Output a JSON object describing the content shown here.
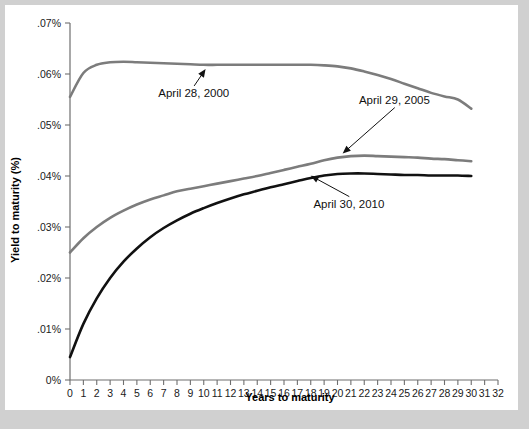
{
  "figure": {
    "background_color": "#d0d0d0",
    "plot_background_color": "#ffffff"
  },
  "chart_data": {
    "type": "line",
    "title": "",
    "xlabel": "Years to maturity",
    "ylabel": "Yield to maturity (%)",
    "xlim": [
      0,
      32
    ],
    "ylim": [
      0,
      0.07
    ],
    "grid": false,
    "legend_position": "inline-annotations",
    "x_tick_labels": [
      "0",
      "1",
      "2",
      "3",
      "4",
      "5",
      "6",
      "7",
      "8",
      "9",
      "10",
      "11",
      "12",
      "13",
      "14",
      "15",
      "16",
      "17",
      "18",
      "19",
      "20",
      "21",
      "22",
      "23",
      "24",
      "25",
      "26",
      "27",
      "28",
      "29",
      "30",
      "31",
      "32"
    ],
    "x_ticks": [
      0,
      1,
      2,
      3,
      4,
      5,
      6,
      7,
      8,
      9,
      10,
      11,
      12,
      13,
      14,
      15,
      16,
      17,
      18,
      19,
      20,
      21,
      22,
      23,
      24,
      25,
      26,
      27,
      28,
      29,
      30,
      31,
      32
    ],
    "y_tick_labels": [
      "0%",
      ".01%",
      ".02%",
      ".03%",
      ".04%",
      ".05%",
      ".06%",
      ".07%"
    ],
    "y_ticks": [
      0,
      0.01,
      0.02,
      0.03,
      0.04,
      0.05,
      0.06,
      0.07
    ],
    "x": [
      0,
      1,
      2,
      3,
      4,
      5,
      6,
      7,
      8,
      9,
      10,
      11,
      12,
      13,
      14,
      15,
      16,
      17,
      18,
      19,
      20,
      21,
      22,
      23,
      24,
      25,
      26,
      27,
      28,
      29,
      30
    ],
    "series": [
      {
        "name": "April 28, 2000",
        "color": "#7c7c7c",
        "width": 2.6,
        "values": [
          0.0555,
          0.0602,
          0.0618,
          0.0623,
          0.0624,
          0.0623,
          0.0622,
          0.0621,
          0.062,
          0.0619,
          0.0618,
          0.0618,
          0.0618,
          0.0618,
          0.0618,
          0.0618,
          0.0618,
          0.0618,
          0.0618,
          0.0617,
          0.0615,
          0.0611,
          0.0605,
          0.0598,
          0.059,
          0.0581,
          0.0572,
          0.0563,
          0.0556,
          0.055,
          0.0532
        ]
      },
      {
        "name": "April 29, 2005",
        "color": "#7c7c7c",
        "width": 2.6,
        "values": [
          0.025,
          0.0278,
          0.03,
          0.0318,
          0.0332,
          0.0344,
          0.0354,
          0.0362,
          0.037,
          0.0375,
          0.038,
          0.0385,
          0.039,
          0.0395,
          0.04,
          0.0406,
          0.0412,
          0.0418,
          0.0424,
          0.0431,
          0.0436,
          0.0439,
          0.044,
          0.0439,
          0.0438,
          0.0437,
          0.0436,
          0.0434,
          0.0433,
          0.0431,
          0.0429
        ]
      },
      {
        "name": "April 30, 2010",
        "color": "#111111",
        "width": 2.6,
        "values": [
          0.0045,
          0.011,
          0.016,
          0.02,
          0.0232,
          0.0258,
          0.028,
          0.0298,
          0.0313,
          0.0326,
          0.0337,
          0.0347,
          0.0356,
          0.0364,
          0.0371,
          0.0378,
          0.0384,
          0.039,
          0.0396,
          0.0401,
          0.0404,
          0.0405,
          0.0405,
          0.0404,
          0.0403,
          0.0402,
          0.0402,
          0.0401,
          0.0401,
          0.0401,
          0.04
        ]
      }
    ],
    "annotations": [
      {
        "label": "April 28, 2000",
        "text_x": 6.6,
        "text_y": 0.0555,
        "point_x": 10.2,
        "point_y": 0.0612
      },
      {
        "label": "April 29, 2005",
        "text_x": 21.6,
        "text_y": 0.0542,
        "point_x": 20.3,
        "point_y": 0.0442
      },
      {
        "label": "April 30, 2010",
        "text_x": 18.2,
        "text_y": 0.0338,
        "point_x": 17.9,
        "point_y": 0.0402
      }
    ]
  }
}
